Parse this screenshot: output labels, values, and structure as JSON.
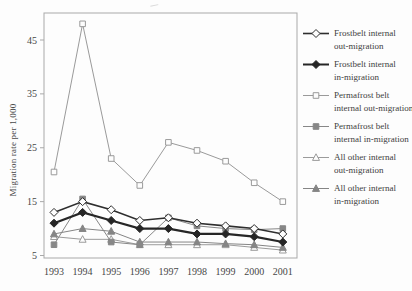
{
  "figure": {
    "background": "#fdfdfd",
    "y_axis_label": "Migration rate per 1,000"
  },
  "chart_data": {
    "type": "line",
    "title": "",
    "xlabel": "",
    "ylabel": "Migration rate per 1,000",
    "x": [
      1993,
      1994,
      1995,
      1996,
      1997,
      1998,
      1999,
      2000,
      2001
    ],
    "y_ticks": [
      45,
      35,
      25,
      15,
      5
    ],
    "ylim": [
      4.5,
      50
    ],
    "grid": false,
    "legend_position": "right",
    "axis_color": "#a9a9a9",
    "text_color": "#474747",
    "series": [
      {
        "name": "Frostbelt internal out-migration",
        "marker": "diamond",
        "marker_fill": "open",
        "color": "#2e2e2e",
        "line_width": 1.6,
        "values": [
          13,
          15,
          13.5,
          11.5,
          12,
          11,
          10.5,
          10,
          9
        ]
      },
      {
        "name": "Frostbelt internal in-migration",
        "marker": "diamond",
        "marker_fill": "solid",
        "color": "#262626",
        "line_width": 2.2,
        "values": [
          11,
          13,
          11.5,
          10,
          10,
          9,
          9,
          8.5,
          7.5
        ]
      },
      {
        "name": "Permafrost belt internal out-migration",
        "marker": "square",
        "marker_fill": "open",
        "color": "#9a9a9a",
        "line_width": 1,
        "values": [
          20.5,
          48,
          23,
          18,
          26,
          24.5,
          22.5,
          18.5,
          15
        ]
      },
      {
        "name": "Permafrost belt internal in-migration",
        "marker": "square",
        "marker_fill": "solid",
        "color": "#878787",
        "line_width": 1,
        "values": [
          7,
          15.5,
          7.5,
          7,
          12,
          10.5,
          10,
          9.8,
          10
        ]
      },
      {
        "name": "All other internal out-migration",
        "marker": "triangle",
        "marker_fill": "open",
        "color": "#9b9b9b",
        "line_width": 1,
        "values": [
          8.5,
          8,
          8,
          7,
          7,
          7,
          7,
          6.5,
          6
        ]
      },
      {
        "name": "All other internal in-migration",
        "marker": "triangle",
        "marker_fill": "solid",
        "color": "#858585",
        "line_width": 1,
        "values": [
          9,
          10,
          9.5,
          7.5,
          7.5,
          7.5,
          7.2,
          7,
          6.5
        ]
      }
    ]
  },
  "legend": {
    "items": [
      {
        "line1": "Frostbelt internal",
        "line2": "out-migration"
      },
      {
        "line1": "Frostbelt internal",
        "line2": "in-migration"
      },
      {
        "line1": "Permafrost belt",
        "line2": "internal out-migration"
      },
      {
        "line1": "Permafrost belt",
        "line2": "internal in-migration"
      },
      {
        "line1": "All other internal",
        "line2": "out-migration"
      },
      {
        "line1": "All other internal",
        "line2": "in-migration"
      }
    ]
  }
}
